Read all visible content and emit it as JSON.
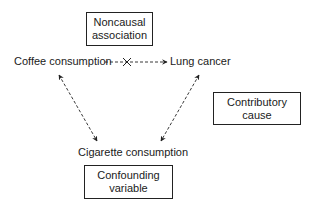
{
  "diagram": {
    "boxes": {
      "noncausal": {
        "line1": "Noncausal",
        "line2": "association"
      },
      "contributory": {
        "line1": "Contributory",
        "line2": "cause"
      },
      "confounding": {
        "line1": "Confounding",
        "line2": "variable"
      }
    },
    "nodes": {
      "coffee": "Coffee consumption",
      "lung_cancer": "Lung cancer",
      "cigarette": "Cigarette consumption"
    },
    "edges": [
      {
        "from": "coffee",
        "to": "lung_cancer",
        "style": "dashed",
        "blocked": true,
        "marker": "x"
      },
      {
        "from": "cigarette",
        "to": "coffee",
        "style": "dashed",
        "bidirectional": true
      },
      {
        "from": "cigarette",
        "to": "lung_cancer",
        "style": "dashed",
        "bidirectional": true
      }
    ],
    "colors": {
      "line": "#222222",
      "background": "#ffffff"
    }
  }
}
